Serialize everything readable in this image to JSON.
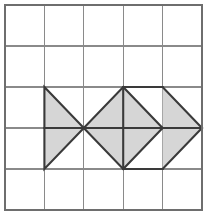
{
  "figure": {
    "canvas": {
      "width": 207,
      "height": 219,
      "background": "#ffffff"
    },
    "grid": {
      "name": "square-lattice",
      "columns": 5,
      "rows": 5,
      "x_positions": [
        5,
        44.4,
        83.8,
        123.2,
        162.6,
        202
      ],
      "y_positions": [
        5,
        46,
        87,
        128,
        169,
        210
      ],
      "line_color": "#8a8a8a",
      "line_width": 1.1,
      "border_color": "#6e6e6e",
      "border_width": 1.4
    },
    "shape": {
      "name": "tangram-fish",
      "fill_color": "#d6d6d6",
      "outline_color": "#3a3a3a",
      "outline_width": 2.1,
      "inner_line_color": "#3a3a3a",
      "inner_line_width": 2.1,
      "parts": [
        {
          "name": "tail-upper-triangle",
          "points": "44.4,87 83.8,128 44.4,128"
        },
        {
          "name": "tail-lower-triangle",
          "points": "44.4,128 83.8,128 44.4,169"
        },
        {
          "name": "body-upper-left-triangle",
          "points": "83.8,128 123.2,87 123.2,128"
        },
        {
          "name": "body-lower-left-triangle",
          "points": "83.8,128 123.2,128 123.2,169"
        },
        {
          "name": "body-upper-right-triangle",
          "points": "123.2,87 162.6,128 123.2,128"
        },
        {
          "name": "body-lower-right-triangle",
          "points": "123.2,128 162.6,128 123.2,169"
        },
        {
          "name": "head-upper-triangle",
          "points": "162.6,87 202,128 162.6,128"
        },
        {
          "name": "head-lower-triangle",
          "points": "162.6,128 202,128 162.6,169"
        }
      ],
      "outline_points": "44.4,87 83.8,128 123.2,87 162.6,87 202,128 162.6,169 123.2,169 83.8,128 44.4,169",
      "internal_segments": [
        {
          "name": "segment-tail-horizontal",
          "x1": 44.4,
          "y1": 128,
          "x2": 83.8,
          "y2": 128
        },
        {
          "name": "segment-body-horizontal",
          "x1": 83.8,
          "y1": 128,
          "x2": 202,
          "y2": 128
        },
        {
          "name": "segment-body-vertical-mid",
          "x1": 123.2,
          "y1": 87,
          "x2": 123.2,
          "y2": 169
        },
        {
          "name": "segment-body-diagonal-upper",
          "x1": 123.2,
          "y1": 87,
          "x2": 162.6,
          "y2": 128
        },
        {
          "name": "segment-body-diagonal-lower",
          "x1": 123.2,
          "y1": 169,
          "x2": 162.6,
          "y2": 128
        },
        {
          "name": "segment-head-top-horizontal",
          "x1": 123.2,
          "y1": 87,
          "x2": 162.6,
          "y2": 87
        },
        {
          "name": "segment-head-bottom-horizontal",
          "x1": 123.2,
          "y1": 169,
          "x2": 162.6,
          "y2": 169
        }
      ]
    }
  }
}
